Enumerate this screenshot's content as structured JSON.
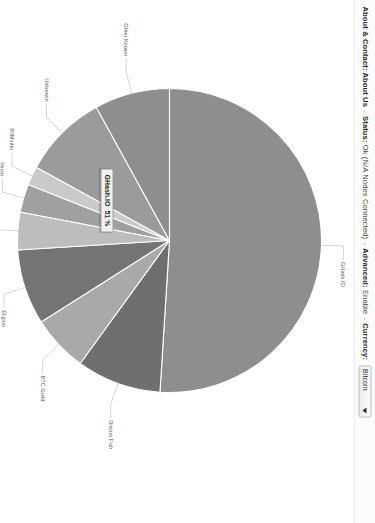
{
  "nav": {
    "about_group_label": "About & Contact:",
    "about_us": "About Us",
    "sep1": "-",
    "status_label": "Status:",
    "status_value": "Ok (N/A Nodes Connected)",
    "sep2": "-",
    "advanced_label": "Advanced:",
    "advanced_value": "Enable",
    "sep3": "-",
    "currency_label": "Currency:",
    "currency_value": "Bitcoin",
    "caret_icon": "chevron-down-icon"
  },
  "tooltip": {
    "name": "GHash.IO",
    "value": "51 %"
  },
  "chart_data": {
    "type": "pie",
    "legend": "labels-on-slices",
    "grid": false,
    "unit": "%",
    "categories": [
      "GHash.IO",
      "Discus Fish",
      "BTC Guild",
      "Eligius",
      "Polmine",
      "Slush",
      "BitMinter",
      "Unknown",
      "Other Known"
    ],
    "values": [
      51,
      9,
      6,
      8,
      4,
      3,
      2,
      9,
      8
    ],
    "colors": [
      "#8e8e8e",
      "#6f6f6f",
      "#a9a9a9",
      "#747474",
      "#bdbdbd",
      "#a0a0a0",
      "#cacaca",
      "#9b9b9b",
      "#8e8e8e"
    ],
    "start_angle_deg": 180,
    "direction": "counterclockwise",
    "highlight": "GHash.IO",
    "highlight_value_label": "51 %"
  }
}
